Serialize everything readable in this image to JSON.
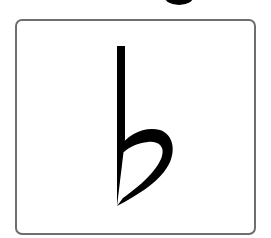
{
  "card": {
    "symbol_name": "flat",
    "symbol_glyph": "♭",
    "border_color": "#6e6e6e",
    "symbol_color": "#000000"
  },
  "cropped_header": {
    "visible_fragment": "descender of cropped title text"
  }
}
